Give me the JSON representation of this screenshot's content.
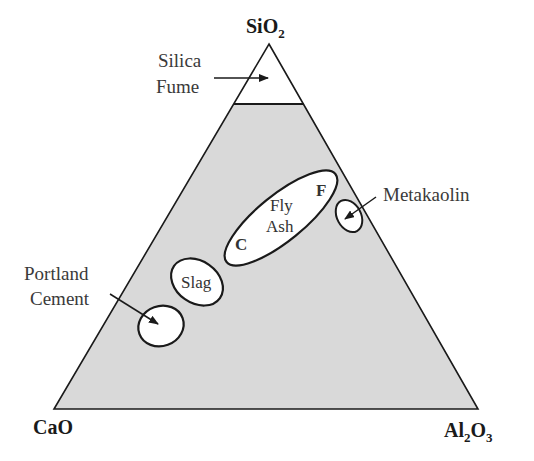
{
  "diagram": {
    "type": "ternary",
    "vertices": {
      "top": {
        "label": "SiO",
        "sub": "2"
      },
      "left": {
        "label": "CaO"
      },
      "right": {
        "label": "Al",
        "sub1": "2",
        "mid": "O",
        "sub2": "3"
      }
    },
    "colors": {
      "shaded_fill": "#d9d9d9",
      "region_fill": "#ffffff",
      "stroke": "#1a1a1a"
    },
    "regions": {
      "silica_fume": {
        "line1": "Silica",
        "line2": "Fume"
      },
      "metakaolin": {
        "label": "Metakaolin"
      },
      "fly_ash": {
        "line1": "Fly",
        "line2": "Ash",
        "class_f": "F",
        "class_c": "C"
      },
      "slag": {
        "label": "Slag"
      },
      "portland_cement": {
        "line1": "Portland",
        "line2": "Cement"
      }
    }
  }
}
